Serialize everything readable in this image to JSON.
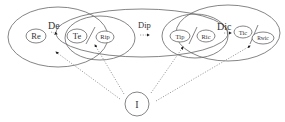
{
  "diagram": {
    "type": "set-relationship-diagram",
    "regions": [
      {
        "id": "region-1",
        "nodes": [
          "Re",
          "Te"
        ],
        "relation": "De"
      },
      {
        "id": "region-2",
        "nodes": [
          "Te",
          "Rip"
        ]
      },
      {
        "id": "region-3",
        "relation": "Dip",
        "spans": [
          "region-2",
          "region-4"
        ]
      },
      {
        "id": "region-4",
        "nodes": [
          "Tip",
          "Ric"
        ],
        "relation": "Dic"
      },
      {
        "id": "region-5",
        "nodes": [
          "Tic",
          "Rwic"
        ]
      }
    ],
    "nodes": {
      "re": "Re",
      "te": "Te",
      "rip": "Rip",
      "tip": "Tip",
      "ric": "Ric",
      "tic": "Tic",
      "rwic": "Rwic",
      "i": "I"
    },
    "relations": {
      "de": "De",
      "dip": "Dip",
      "dic": "Dic"
    },
    "edges": [
      {
        "from": "I",
        "to": "region-1",
        "style": "dotted-arrow"
      },
      {
        "from": "I",
        "to": "region-2",
        "style": "dotted-arrow"
      },
      {
        "from": "I",
        "to": "region-4",
        "style": "dotted-arrow"
      },
      {
        "from": "I",
        "to": "region-5",
        "style": "dotted-arrow"
      }
    ]
  }
}
